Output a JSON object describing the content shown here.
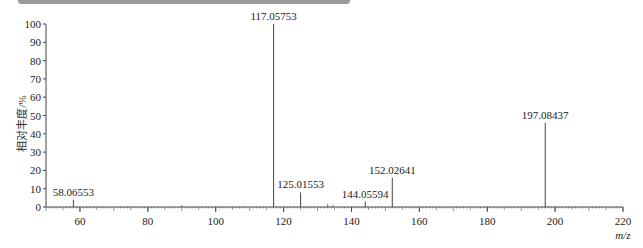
{
  "chart_data": {
    "type": "bar",
    "title": "",
    "xlabel": "m/z",
    "ylabel": "相对丰度/%",
    "xlim": [
      50,
      220
    ],
    "ylim": [
      0,
      100
    ],
    "x_ticks": [
      60,
      80,
      100,
      120,
      140,
      160,
      180,
      200,
      220
    ],
    "y_ticks": [
      0,
      10,
      20,
      30,
      40,
      50,
      60,
      70,
      80,
      90,
      100
    ],
    "grid": false,
    "legend": null,
    "peaks": [
      {
        "mz": 58.06553,
        "label": "58.06553",
        "intensity": 4
      },
      {
        "mz": 117.05753,
        "label": "117.05753",
        "intensity": 100
      },
      {
        "mz": 125.01553,
        "label": "125.01553",
        "intensity": 8
      },
      {
        "mz": 144.05594,
        "label": "144.05594",
        "intensity": 3
      },
      {
        "mz": 152.02641,
        "label": "152.02641",
        "intensity": 16
      },
      {
        "mz": 197.08437,
        "label": "197.08437",
        "intensity": 46
      }
    ],
    "minor_peaks": [
      {
        "mz": 90,
        "intensity": 1
      },
      {
        "mz": 133,
        "intensity": 1.5
      },
      {
        "mz": 134.5,
        "intensity": 1
      }
    ]
  }
}
